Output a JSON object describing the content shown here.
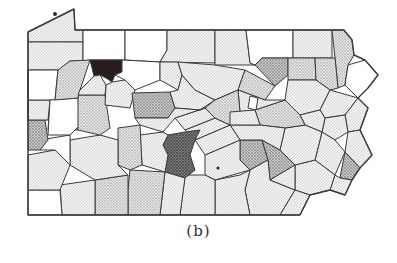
{
  "figure": {
    "caption": "(b)",
    "legend": null
  },
  "shading_classes": [
    {
      "level": 0,
      "name": "white",
      "color": "#ffffff"
    },
    {
      "level": 1,
      "name": "light-hatch",
      "color": "#ececea"
    },
    {
      "level": 2,
      "name": "medium-light-hatch",
      "color": "#d6d6d4"
    },
    {
      "level": 3,
      "name": "medium-hatch",
      "color": "#b4b4b2"
    },
    {
      "level": 4,
      "name": "dark-hatch",
      "color": "#6a6a6a"
    },
    {
      "level": 5,
      "name": "darkest",
      "color": "#2b1a1a"
    }
  ],
  "highlighted_regions": [
    {
      "position": "north-west interior (Forest/Venango area)",
      "shade": "darkest"
    },
    {
      "position": "south-central (Huntingdon area)",
      "shade": "dark-hatch"
    },
    {
      "position": "east-central (Lebanon/Lancaster area)",
      "shade": "medium-hatch"
    },
    {
      "position": "north-east (Wyoming area)",
      "shade": "medium-hatch"
    },
    {
      "position": "south-east corner (Philadelphia)",
      "shade": "medium-hatch"
    }
  ]
}
